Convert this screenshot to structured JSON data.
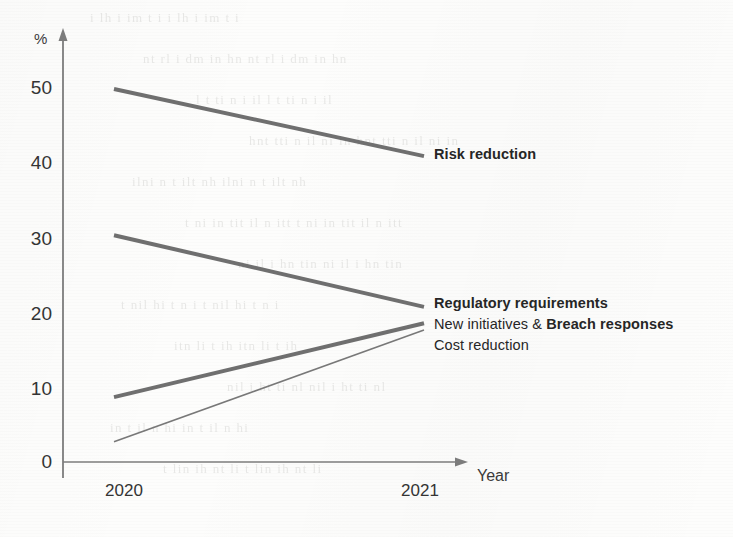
{
  "chart_data": {
    "type": "line",
    "title": "",
    "subtitle": "",
    "xlabel": "Year",
    "ylabel": "%",
    "x": [
      "2020",
      "2021"
    ],
    "categories": [
      "2020",
      "2021"
    ],
    "xlim": [
      "2020",
      "2021"
    ],
    "ylim": [
      0,
      55
    ],
    "y_ticks": [
      0,
      10,
      20,
      30,
      40,
      50
    ],
    "y_tick_labels": [
      "0",
      "10",
      "20",
      "30",
      "40",
      "50"
    ],
    "grid": false,
    "legend": "inline-right-of-line-ends",
    "series": [
      {
        "name": "Risk reduction",
        "label_html": "Risk reduction",
        "bold": true,
        "stroke_width": 4,
        "color": "#6f6f6f",
        "values": [
          50.0,
          41.0
        ]
      },
      {
        "name": "Regulatory requirements",
        "label_html": "Regulatory requirements",
        "bold": true,
        "stroke_width": 4,
        "color": "#6f6f6f",
        "values": [
          30.4,
          20.8
        ]
      },
      {
        "name": "New initiatives & Breach responses",
        "label_html": "New initiatives &amp; <span class=\"b\">Breach responses</span>",
        "bold": false,
        "stroke_width": 4,
        "color": "#6f6f6f",
        "values": [
          8.7,
          18.6
        ]
      },
      {
        "name": "Cost reduction",
        "label_html": "Cost reduction",
        "bold": false,
        "stroke_width": 1.6,
        "color": "#787878",
        "values": [
          2.7,
          17.7
        ]
      }
    ],
    "annotations": []
  },
  "axes": {
    "y_unit_label": "%",
    "x_axis_label": "Year",
    "y_ticks": [
      "50",
      "40",
      "30",
      "20",
      "10",
      "0"
    ],
    "x_ticks": [
      "2020",
      "2021"
    ]
  },
  "labels": {
    "risk_reduction": "Risk reduction",
    "regulatory_requirements": "Regulatory requirements",
    "new_initiatives_prefix": "New initiatives & ",
    "breach_responses": "Breach responses",
    "cost_reduction": "Cost reduction"
  },
  "colors": {
    "line": "#6f6f6f",
    "thin_line": "#787878",
    "axis": "#7c7c7c",
    "text": "#343434",
    "label_text": "#262626",
    "background": "#fdfdfc"
  },
  "scan_ghost_text": [
    "  i      lh       i          im    t  i",
    "   nt       rl   i    dm      in  hn",
    "    l   t  ti    n     i    il",
    "  hnt      tti    n  il     ni     in",
    "       ilni     n  t      ilt  nh",
    "  t   ni   in   tit    il      n  itt",
    "      ni     il       i  hn     tin",
    "        t  nil      hi   t    n   i",
    "    itn        li       t  ih",
    "   nil   i     ht       ti   nl",
    "      in   t       il    n  hi",
    "   t  lin       ih    nt      li"
  ]
}
